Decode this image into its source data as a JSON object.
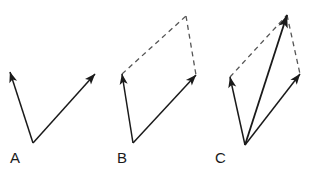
{
  "figure": {
    "background_color": "#ffffff",
    "stroke_color": "#1a1a1a",
    "dashed_color": "#555555",
    "width": 311,
    "height": 170
  },
  "panels": [
    {
      "id": "A",
      "label": "A",
      "label_x": 10,
      "label_y": 163,
      "caption": "Two vectors drawn from a common origin",
      "origin": {
        "x": 33,
        "y": 143
      },
      "solid_vectors": [
        {
          "name": "vector-a-left",
          "x1": 33,
          "y1": 143,
          "x2": 10,
          "y2": 72
        },
        {
          "name": "vector-a-right",
          "x1": 33,
          "y1": 143,
          "x2": 95,
          "y2": 74
        }
      ],
      "dashed_lines": [],
      "resultant": null
    },
    {
      "id": "B",
      "label": "B",
      "label_x": 117,
      "label_y": 163,
      "caption": "Parallelogram completed with dashed construction lines",
      "origin": {
        "x": 133,
        "y": 143
      },
      "solid_vectors": [
        {
          "name": "vector-b-left",
          "x1": 133,
          "y1": 143,
          "x2": 122,
          "y2": 74
        },
        {
          "name": "vector-b-right",
          "x1": 133,
          "y1": 143,
          "x2": 196,
          "y2": 75
        }
      ],
      "dashed_lines": [
        {
          "name": "dashed-b-top-left",
          "x1": 122,
          "y1": 74,
          "x2": 186,
          "y2": 16
        },
        {
          "name": "dashed-b-top-right",
          "x1": 186,
          "y1": 16,
          "x2": 196,
          "y2": 75
        }
      ],
      "resultant": null
    },
    {
      "id": "C",
      "label": "C",
      "label_x": 215,
      "label_y": 163,
      "caption": "Resultant vector drawn along the diagonal of the parallelogram",
      "origin": {
        "x": 245,
        "y": 145
      },
      "solid_vectors": [
        {
          "name": "vector-c-left",
          "x1": 245,
          "y1": 145,
          "x2": 230,
          "y2": 77
        },
        {
          "name": "vector-c-right",
          "x1": 245,
          "y1": 145,
          "x2": 300,
          "y2": 74
        }
      ],
      "dashed_lines": [
        {
          "name": "dashed-c-top-left",
          "x1": 230,
          "y1": 77,
          "x2": 287,
          "y2": 15
        },
        {
          "name": "dashed-c-top-right",
          "x1": 287,
          "y1": 15,
          "x2": 300,
          "y2": 74
        }
      ],
      "resultant": {
        "name": "vector-c-resultant",
        "x1": 245,
        "y1": 145,
        "x2": 287,
        "y2": 15
      }
    }
  ]
}
